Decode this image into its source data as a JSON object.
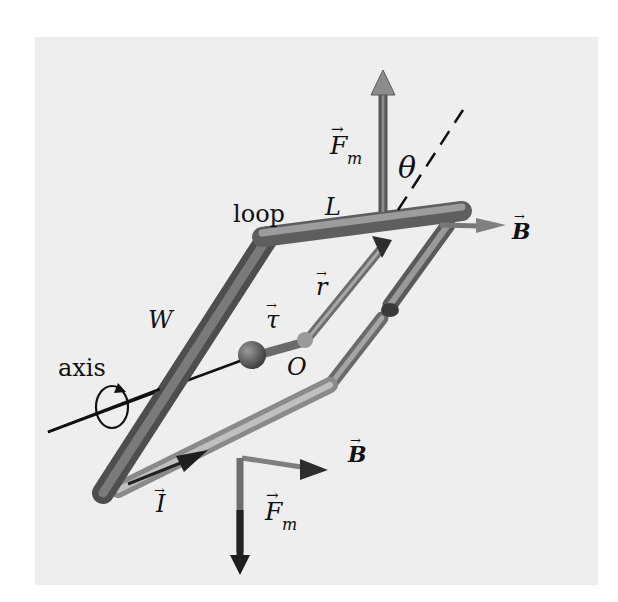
{
  "figure": {
    "background": "#ffffff",
    "panel_color": "#eeeeee",
    "tube_color": "#7a7a7a",
    "tube_light": "#a8a8a8",
    "tube_dark": "#4a4a4a",
    "labels": {
      "force_top": "F",
      "force_top_sub": "m",
      "theta": "θ",
      "length": "L",
      "loop": "loop",
      "field_top": "B",
      "position": "r",
      "torque": "τ",
      "width": "W",
      "origin": "O",
      "axis": "axis",
      "field_bottom": "B",
      "current": "I",
      "force_bottom": "F",
      "force_bottom_sub": "m",
      "vector_arrow": "→"
    }
  }
}
